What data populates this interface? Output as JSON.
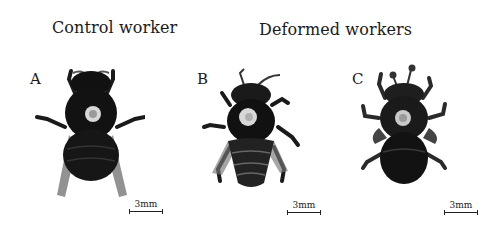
{
  "headings": {
    "control": "Control worker",
    "deformed": "Deformed workers"
  },
  "panels": [
    {
      "label": "A",
      "description": "control worker bee, dorsal view, dark body with pale thoracic marker",
      "scale": "3mm"
    },
    {
      "label": "B",
      "description": "deformed worker bee with shortened wings",
      "scale": "3mm"
    },
    {
      "label": "C",
      "description": "deformed worker bee with crumpled wings",
      "scale": "3mm"
    }
  ],
  "colors": {
    "background": "#ffffff",
    "body": "#141414",
    "marker": "#d8d8d8",
    "text": "#1a1a1a"
  }
}
